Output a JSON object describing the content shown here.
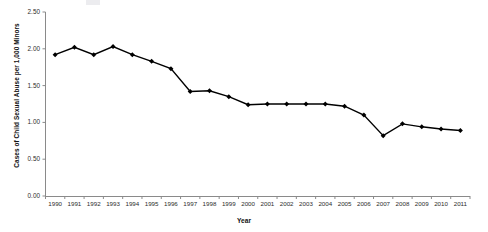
{
  "chart_data": {
    "type": "line",
    "title": "",
    "xlabel": "Year",
    "ylabel": "Cases of Child Sexual Abuse per 1,000 Minors",
    "categories": [
      "1990",
      "1991",
      "1992",
      "1993",
      "1994",
      "1995",
      "1996",
      "1997",
      "1998",
      "1999",
      "2000",
      "2001",
      "2002",
      "2003",
      "2004",
      "2005",
      "2006",
      "2007",
      "2008",
      "2009",
      "2010",
      "2011"
    ],
    "values": [
      1.92,
      2.02,
      1.92,
      2.03,
      1.92,
      1.83,
      1.73,
      1.42,
      1.43,
      1.35,
      1.24,
      1.25,
      1.25,
      1.25,
      1.25,
      1.22,
      1.1,
      0.82,
      0.98,
      0.94,
      0.91,
      0.89
    ],
    "ylim": [
      0.0,
      2.5
    ],
    "y_ticks": [
      "0.00",
      "0.50",
      "1.00",
      "1.50",
      "2.00",
      "2.50"
    ],
    "y_tick_values": [
      0.0,
      0.5,
      1.0,
      1.5,
      2.0,
      2.5
    ],
    "grid": false,
    "legend": "none",
    "marker": "diamond",
    "series_color": "#000000",
    "axis_color": "#808080"
  }
}
